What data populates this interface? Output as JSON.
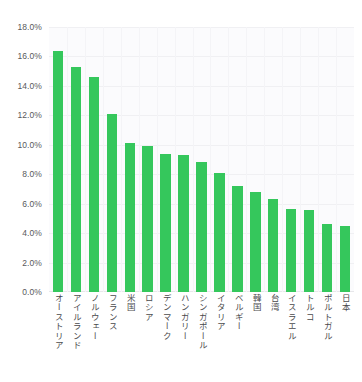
{
  "chart_data": {
    "type": "bar",
    "title": "",
    "subtitle": "",
    "xlabel": "",
    "ylabel": "",
    "ylim": [
      0,
      18
    ],
    "ytick_labels": [
      "18.0%",
      "16.0%",
      "14.0%",
      "12.0%",
      "10.0%",
      "8.0%",
      "6.0%",
      "4.0%",
      "2.0%",
      "0.0%"
    ],
    "ytick_values": [
      18,
      16,
      14,
      12,
      10,
      8,
      6,
      4,
      2,
      0
    ],
    "grid": true,
    "legend": false,
    "bar_color": "#35c75c",
    "plot_background": "#fbfbfd",
    "categories": [
      "オーストリア",
      "アイルランド",
      "ノルウェー",
      "フランス",
      "米国",
      "ロシア",
      "デンマーク",
      "ハンガリー",
      "シンガポール",
      "イタリア",
      "ベルギー",
      "韓国",
      "台湾",
      "イスラエル",
      "トルコ",
      "ポルトガル",
      "日本"
    ],
    "values": [
      16.4,
      15.3,
      14.6,
      12.1,
      10.1,
      9.9,
      9.4,
      9.3,
      8.8,
      8.1,
      7.2,
      6.8,
      6.3,
      5.65,
      5.6,
      4.6,
      4.5
    ]
  }
}
